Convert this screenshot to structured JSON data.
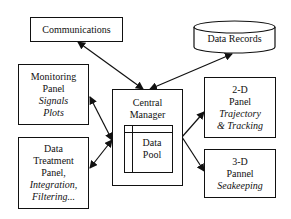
{
  "diagram": {
    "nodes": {
      "communications": {
        "label": "Communications"
      },
      "data_records": {
        "label": "Data Records",
        "shape": "cylinder"
      },
      "monitoring_panel": {
        "line1": "Monitoring",
        "line2": "Panel",
        "italic1": "Signals",
        "italic2": "Plots"
      },
      "central_manager": {
        "line1": "Central",
        "line2": "Manager"
      },
      "data_pool": {
        "line1": "Data",
        "line2": "Pool"
      },
      "data_treatment_panel": {
        "line1": "Data",
        "line2": "Treatment",
        "line3": "Panel,",
        "italic1": "Integration,",
        "italic2": "Filtering..."
      },
      "panel_2d": {
        "line1": "2-D",
        "line2": "Panel",
        "italic1": "Trajectory",
        "italic2": "& Tracking"
      },
      "panel_3d": {
        "line1": "3-D",
        "line2": "Pannel",
        "italic1": "Seakeeping"
      }
    },
    "edges": [
      {
        "from": "communications",
        "to": "central_manager",
        "type": "bidirectional"
      },
      {
        "from": "data_records",
        "to": "central_manager",
        "type": "bidirectional"
      },
      {
        "from": "monitoring_panel",
        "to": "central_manager",
        "type": "bidirectional"
      },
      {
        "from": "data_treatment_panel",
        "to": "central_manager",
        "type": "bidirectional"
      },
      {
        "from": "central_manager",
        "to": "panel_2d",
        "type": "directed"
      },
      {
        "from": "central_manager",
        "to": "panel_3d",
        "type": "directed"
      }
    ]
  }
}
